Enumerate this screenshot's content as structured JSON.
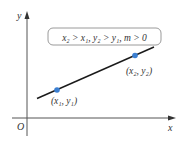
{
  "diagram": {
    "axes": {
      "x_label": "x",
      "y_label": "y",
      "origin_label": "O"
    },
    "condition_box": {
      "text": "x₂ > x₁, y₂ > y₁, m > 0"
    },
    "points": [
      {
        "label": "(x₁, y₁)",
        "color": "#3b7fd1"
      },
      {
        "label": "(x₂, y₂)",
        "color": "#3b7fd1"
      }
    ],
    "line_color": "#1a1a1a",
    "axis_color": "#555555"
  }
}
